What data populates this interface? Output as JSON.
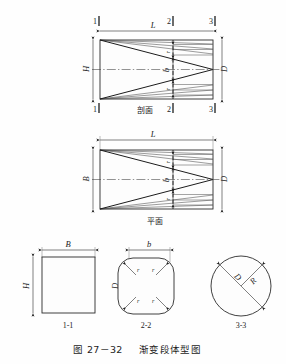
{
  "figure": {
    "caption_number": "图 27－32",
    "caption_title": "渐变段体型图",
    "background_color": "#fefefe",
    "line_color": "#1c1c1c"
  },
  "views": {
    "section_view": {
      "name": "剖面",
      "label": "剖面",
      "dim_length": "L",
      "dim_height_left": "H",
      "dim_height_right": "D",
      "dim_mid_b": "b",
      "dim_fillet_top": "r",
      "dim_fillet_bottom": "r",
      "section_marks_top": [
        "1",
        "2",
        "3"
      ],
      "section_marks_bottom": [
        "1",
        "2",
        "3"
      ]
    },
    "plan_view": {
      "name": "平面",
      "label": "平面",
      "dim_length": "L",
      "dim_width_left": "B",
      "dim_width_right": "D",
      "dim_mid_b": "b",
      "dim_fillet_top": "r",
      "dim_fillet_bottom": "r"
    },
    "cross_sections": [
      {
        "id": "section-1-1",
        "label": "1-1",
        "shape": "rectangle",
        "dim_width": "B",
        "dim_height": "H"
      },
      {
        "id": "section-2-2",
        "label": "2-2",
        "shape": "rounded-square",
        "dim_width": "b",
        "dim_height": "D",
        "dim_fillet_tl": "r",
        "dim_fillet_tr": "r",
        "dim_fillet_bl": "r",
        "dim_fillet_br": "r"
      },
      {
        "id": "section-3-3",
        "label": "3-3",
        "shape": "circle",
        "dim_diameter": "D",
        "dim_radius": "R"
      }
    ]
  }
}
